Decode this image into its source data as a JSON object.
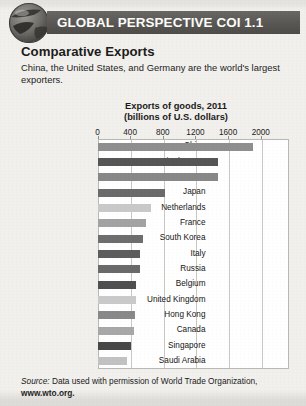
{
  "header": {
    "banner_label": "GLOBAL PERSPECTIVE COI 1.1",
    "icon": "globe-icon",
    "banner_color": "#5d5b58"
  },
  "article": {
    "title": "Comparative Exports",
    "body": "China, the United States, and Germany are the world's largest exporters."
  },
  "source": {
    "prefix": "Source:",
    "text": " Data used with permission of World Trade Organization,",
    "url": "www.wto.org."
  },
  "chart_data": {
    "type": "bar",
    "orientation": "horizontal",
    "title": "Exports of goods, 2011",
    "subtitle": "(billions of U.S. dollars)",
    "xlabel": "",
    "ylabel": "",
    "xlim": [
      0,
      2000
    ],
    "xticks": [
      0,
      400,
      800,
      1200,
      1600,
      2000
    ],
    "xtick_labels": [
      "0",
      "400",
      "800",
      "1200",
      "1600",
      "2000"
    ],
    "grid": "vertical",
    "legend": "none",
    "categories": [
      "China",
      "United States",
      "Germany",
      "Japan",
      "Netherlands",
      "France",
      "South Korea",
      "Italy",
      "Russia",
      "Belgium",
      "United Kingdom",
      "Hong Kong",
      "Canada",
      "Singapore",
      "Saudi Arabia"
    ],
    "values": [
      1899,
      1480,
      1474,
      823,
      661,
      597,
      555,
      523,
      522,
      477,
      473,
      456,
      452,
      410,
      365
    ],
    "bar_colors": [
      "#8f8f8f",
      "#565656",
      "#888888",
      "#6b6b6b",
      "#c9c9c9",
      "#a3a3a3",
      "#6e6e6e",
      "#5d5d5d",
      "#6a6a6a",
      "#505050",
      "#cacaca",
      "#898989",
      "#a8a8a8",
      "#484848",
      "#c2c2c2"
    ]
  }
}
